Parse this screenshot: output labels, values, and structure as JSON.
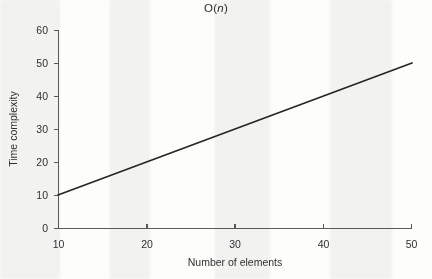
{
  "chart_data": {
    "type": "line",
    "title": "O(n)",
    "title_plain": "O(",
    "title_italic": "n",
    "title_close": ")",
    "xlabel": "Number of elements",
    "ylabel": "Time complexity",
    "xlim": [
      10,
      50
    ],
    "ylim": [
      0,
      60
    ],
    "xticks": [
      10,
      20,
      30,
      40,
      50
    ],
    "yticks": [
      0,
      10,
      20,
      30,
      40,
      50,
      60
    ],
    "xtick_labels": [
      "10",
      "20",
      "30",
      "40",
      "50"
    ],
    "ytick_labels": [
      "0",
      "10",
      "20",
      "30",
      "40",
      "50",
      "60"
    ],
    "grid": false,
    "legend": false,
    "series": [
      {
        "name": "O(n)",
        "color": "#262626",
        "x": [
          10,
          20,
          30,
          40,
          50
        ],
        "values": [
          10,
          20,
          30,
          40,
          50
        ]
      }
    ]
  },
  "figure": {
    "background_color": "#fdfdfc",
    "axis_color": "#59595a",
    "text_color": "#2f2f2f"
  }
}
